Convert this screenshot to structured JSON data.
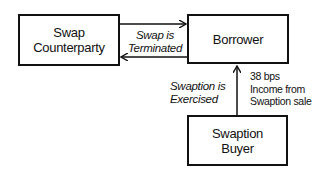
{
  "nodes": {
    "swap_counterparty": {
      "label_line1": "Swap",
      "label_line2": "Counterparty"
    },
    "borrower": {
      "label": "Borrower"
    },
    "swaption_buyer": {
      "label_line1": "Swaption",
      "label_line2": "Buyer"
    }
  },
  "edges": {
    "swap_terminated": {
      "label_line1": "Swap is",
      "label_line2": "Terminated"
    },
    "swaption_exercised": {
      "label_line1": "Swaption is",
      "label_line2": "Exercised"
    },
    "income_note": {
      "line1": "38 bps",
      "line2": "Income from",
      "line3": "Swaption sale"
    }
  }
}
